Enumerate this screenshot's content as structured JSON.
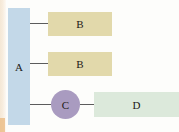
{
  "diagram": {
    "title_fragment": "",
    "nodes": [
      {
        "id": "A",
        "label": "A",
        "shape": "rectangle",
        "color": "#c3d8e8"
      },
      {
        "id": "B1",
        "label": "B",
        "shape": "rectangle",
        "color": "#e2d9ab"
      },
      {
        "id": "B2",
        "label": "B",
        "shape": "rectangle",
        "color": "#e2d9ab"
      },
      {
        "id": "C",
        "label": "C",
        "shape": "circle",
        "color": "#a99bc0"
      },
      {
        "id": "D",
        "label": "D",
        "shape": "rectangle",
        "color": "#dce9db"
      }
    ],
    "connectors": [
      {
        "from": "A",
        "to": "B1",
        "style": "line"
      },
      {
        "from": "A",
        "to": "B2",
        "style": "line"
      },
      {
        "from": "A",
        "to": "C",
        "style": "line"
      },
      {
        "from": "C",
        "to": "D",
        "style": "line"
      }
    ],
    "line_color": "#5c5c5c",
    "background": "#fdfdfb"
  }
}
